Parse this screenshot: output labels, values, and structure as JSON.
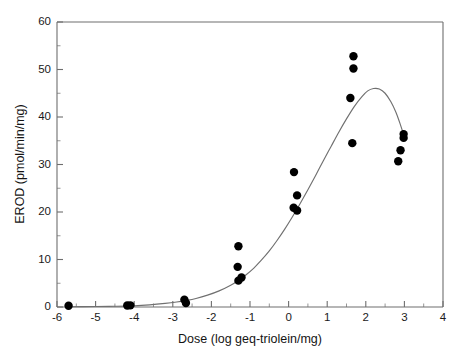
{
  "chart_data": {
    "type": "scatter",
    "title": "",
    "xlabel": "Dose (log geq-triolein/mg)",
    "ylabel": "EROD (pmol/min/mg)",
    "xlim": [
      -6,
      4
    ],
    "ylim": [
      0,
      60
    ],
    "xticks": [
      -6,
      -5,
      -4,
      -3,
      -2,
      -1,
      0,
      1,
      2,
      3,
      4
    ],
    "xtick_labels": [
      "-6",
      "-5",
      "-4",
      "-3",
      "-2",
      "-1",
      "0",
      "1",
      "2",
      "3",
      "4"
    ],
    "yticks": [
      0,
      10,
      20,
      30,
      40,
      50,
      60
    ],
    "ytick_labels": [
      "0",
      "10",
      "20",
      "30",
      "40",
      "50",
      "60"
    ],
    "x_minor_step": 0.5,
    "y_minor_step": 5,
    "grid": false,
    "legend": null,
    "marker": {
      "shape": "circle",
      "color": "#000000",
      "radius_px": 4.2
    },
    "curve": {
      "name": "fitted dose-response curve",
      "color": "#707070",
      "width_px": 1.15,
      "x_start": -5.75,
      "x_end": 3.02,
      "peak_x": 1.9,
      "peak_y": 46.0,
      "points": [
        [
          -5.75,
          0.05
        ],
        [
          -5.0,
          0.1
        ],
        [
          -4.5,
          0.15
        ],
        [
          -4.0,
          0.25
        ],
        [
          -3.6,
          0.45
        ],
        [
          -3.2,
          0.75
        ],
        [
          -2.9,
          1.05
        ],
        [
          -2.67,
          1.35
        ],
        [
          -2.4,
          1.8
        ],
        [
          -2.1,
          2.5
        ],
        [
          -1.8,
          3.4
        ],
        [
          -1.5,
          4.6
        ],
        [
          -1.3,
          5.6
        ],
        [
          -1.1,
          6.8
        ],
        [
          -0.9,
          8.2
        ],
        [
          -0.7,
          9.9
        ],
        [
          -0.5,
          11.8
        ],
        [
          -0.3,
          14.0
        ],
        [
          -0.1,
          16.4
        ],
        [
          0.1,
          19.0
        ],
        [
          0.3,
          21.8
        ],
        [
          0.5,
          24.7
        ],
        [
          0.7,
          27.7
        ],
        [
          0.9,
          30.8
        ],
        [
          1.1,
          33.8
        ],
        [
          1.3,
          36.8
        ],
        [
          1.5,
          39.6
        ],
        [
          1.7,
          42.2
        ],
        [
          1.9,
          44.3
        ],
        [
          2.05,
          45.5
        ],
        [
          2.2,
          46.0
        ],
        [
          2.35,
          45.9
        ],
        [
          2.5,
          45.0
        ],
        [
          2.65,
          43.2
        ],
        [
          2.78,
          41.0
        ],
        [
          2.9,
          38.3
        ],
        [
          3.02,
          35.3
        ]
      ]
    },
    "series": [
      {
        "name": "EROD activity",
        "points": [
          {
            "x": -5.7,
            "y": 0.25
          },
          {
            "x": -4.18,
            "y": 0.3
          },
          {
            "x": -4.1,
            "y": 0.35
          },
          {
            "x": -2.7,
            "y": 1.55
          },
          {
            "x": -2.66,
            "y": 0.85
          },
          {
            "x": -1.3,
            "y": 12.8
          },
          {
            "x": -1.32,
            "y": 8.45
          },
          {
            "x": -1.3,
            "y": 5.55
          },
          {
            "x": -1.22,
            "y": 6.2
          },
          {
            "x": 0.14,
            "y": 28.4
          },
          {
            "x": 0.22,
            "y": 23.5
          },
          {
            "x": 0.13,
            "y": 20.9
          },
          {
            "x": 0.22,
            "y": 20.3
          },
          {
            "x": 1.68,
            "y": 52.8
          },
          {
            "x": 1.68,
            "y": 50.2
          },
          {
            "x": 1.6,
            "y": 44.0
          },
          {
            "x": 1.65,
            "y": 34.5
          },
          {
            "x": 2.98,
            "y": 36.4
          },
          {
            "x": 2.98,
            "y": 35.6
          },
          {
            "x": 2.9,
            "y": 33.0
          },
          {
            "x": 2.84,
            "y": 30.7
          }
        ]
      }
    ]
  },
  "figure": {
    "background_color": "#ffffff",
    "axis_color": "#6e6e6e",
    "text_color": "#1a1a1a"
  }
}
